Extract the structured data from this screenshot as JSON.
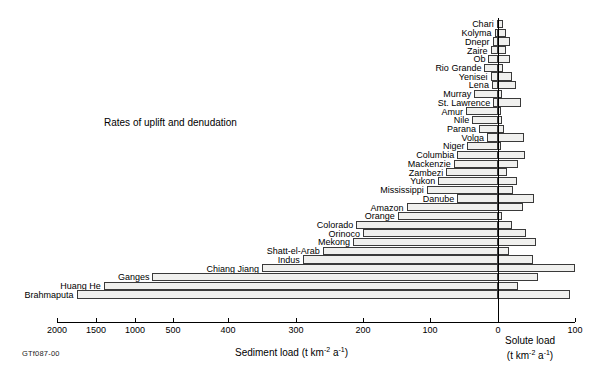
{
  "figure": {
    "note": "Rates of uplift and denudation",
    "figure_id": "GTf087-00"
  },
  "chart_data": {
    "type": "bar",
    "orientation": "horizontal-diverging",
    "title": "Rates of uplift and denudation",
    "xlabel_left": "Sediment load (t km⁻² a⁻¹)",
    "xlabel_right": "Solute load (t km⁻² a⁻¹)",
    "ylabel": "",
    "grid": false,
    "legend": "none",
    "axis_note": "Left axis (sediment load) uses a broken/compressed scale above 400; right axis is solute load 0-100.",
    "left_axis": {
      "label": "Sediment load (t km⁻² a⁻¹)",
      "ticks": [
        2000,
        1500,
        1000,
        500,
        400,
        300,
        200,
        100,
        0
      ],
      "tick_labels": [
        "2000",
        "1500",
        "1000",
        "500",
        "400",
        "300",
        "200",
        "100",
        "0"
      ],
      "tick_x": [
        57,
        96,
        135,
        173,
        228,
        296,
        363,
        430,
        498
      ]
    },
    "right_axis": {
      "label": "Solute load (t km⁻² a⁻¹)",
      "ticks": [
        0,
        100
      ],
      "tick_labels": [
        "0",
        "100"
      ],
      "tick_x": [
        498,
        575
      ]
    },
    "categories": [
      "Chari",
      "Kolyma",
      "Dnepr",
      "Zaire",
      "Ob",
      "Rio Grande",
      "Yenisei",
      "Lena",
      "Murray",
      "St. Lawrence",
      "Amur",
      "Nile",
      "Parana",
      "Volga",
      "Niger",
      "Columbia",
      "Mackenzie",
      "Zambezi",
      "Yukon",
      "Mississippi",
      "Danube",
      "Amazon",
      "Orange",
      "Colorado",
      "Orinoco",
      "Mekong",
      "Shatt-el-Arab",
      "Indus",
      "Chiang Jiang",
      "Ganges",
      "Huang He",
      "Brahmaputa"
    ],
    "series": [
      {
        "name": "Sediment load",
        "units": "t km⁻² a⁻¹",
        "side": "left",
        "values": [
          2,
          5,
          8,
          11,
          14,
          20,
          11,
          9,
          35,
          7,
          47,
          38,
          28,
          16,
          45,
          60,
          65,
          76,
          88,
          105,
          60,
          135,
          148,
          210,
          200,
          215,
          260,
          290,
          350,
          770,
          1400,
          1750
        ]
      },
      {
        "name": "Solute load",
        "units": "t km⁻² a⁻¹",
        "side": "right",
        "values": [
          6,
          11,
          16,
          10,
          16,
          7,
          18,
          23,
          5,
          30,
          4,
          5,
          8,
          34,
          4,
          35,
          26,
          12,
          25,
          20,
          47,
          32,
          5,
          18,
          36,
          49,
          14,
          45,
          100,
          52,
          26,
          93
        ]
      }
    ]
  },
  "rows": [
    {
      "label": "Chari",
      "sediment": 2,
      "solute": 6
    },
    {
      "label": "Kolyma",
      "sediment": 5,
      "solute": 11
    },
    {
      "label": "Dnepr",
      "sediment": 8,
      "solute": 16
    },
    {
      "label": "Zaire",
      "sediment": 11,
      "solute": 10
    },
    {
      "label": "Ob",
      "sediment": 14,
      "solute": 16
    },
    {
      "label": "Rio Grande",
      "sediment": 20,
      "solute": 7
    },
    {
      "label": "Yenisei",
      "sediment": 11,
      "solute": 18
    },
    {
      "label": "Lena",
      "sediment": 9,
      "solute": 23
    },
    {
      "label": "Murray",
      "sediment": 35,
      "solute": 5
    },
    {
      "label": "St. Lawrence",
      "sediment": 7,
      "solute": 30
    },
    {
      "label": "Amur",
      "sediment": 47,
      "solute": 4
    },
    {
      "label": "Nile",
      "sediment": 38,
      "solute": 5
    },
    {
      "label": "Parana",
      "sediment": 28,
      "solute": 8
    },
    {
      "label": "Volga",
      "sediment": 16,
      "solute": 34
    },
    {
      "label": "Niger",
      "sediment": 45,
      "solute": 4
    },
    {
      "label": "Columbia",
      "sediment": 60,
      "solute": 35
    },
    {
      "label": "Mackenzie",
      "sediment": 65,
      "solute": 26
    },
    {
      "label": "Zambezi",
      "sediment": 76,
      "solute": 12
    },
    {
      "label": "Yukon",
      "sediment": 88,
      "solute": 25
    },
    {
      "label": "Mississippi",
      "sediment": 105,
      "solute": 20
    },
    {
      "label": "Danube",
      "sediment": 60,
      "solute": 47
    },
    {
      "label": "Amazon",
      "sediment": 135,
      "solute": 32
    },
    {
      "label": "Orange",
      "sediment": 148,
      "solute": 5
    },
    {
      "label": "Colorado",
      "sediment": 210,
      "solute": 18
    },
    {
      "label": "Orinoco",
      "sediment": 200,
      "solute": 36
    },
    {
      "label": "Mekong",
      "sediment": 215,
      "solute": 49
    },
    {
      "label": "Shatt-el-Arab",
      "sediment": 260,
      "solute": 14
    },
    {
      "label": "Indus",
      "sediment": 290,
      "solute": 45
    },
    {
      "label": "Chiang Jiang",
      "sediment": 350,
      "solute": 100
    },
    {
      "label": "Ganges",
      "sediment": 770,
      "solute": 52
    },
    {
      "label": "Huang He",
      "sediment": 1400,
      "solute": 26
    },
    {
      "label": "Brahmaputa",
      "sediment": 1750,
      "solute": 93
    }
  ],
  "axes": {
    "left_ticks": [
      {
        "value": 2000,
        "label": "2000",
        "x": 57
      },
      {
        "value": 1500,
        "label": "1500",
        "x": 96
      },
      {
        "value": 1000,
        "label": "1000",
        "x": 135
      },
      {
        "value": 500,
        "label": "500",
        "x": 173
      },
      {
        "value": 400,
        "label": "400",
        "x": 228
      },
      {
        "value": 300,
        "label": "300",
        "x": 296
      },
      {
        "value": 200,
        "label": "200",
        "x": 363
      },
      {
        "value": 100,
        "label": "100",
        "x": 430
      },
      {
        "value": 0,
        "label": "0",
        "x": 498
      }
    ],
    "right_ticks": [
      {
        "value": 100,
        "label": "100",
        "x": 575
      }
    ],
    "sediment_title_line1": "Sediment load (t km",
    "sediment_title_sup1": "-2",
    "sediment_title_mid": " a",
    "sediment_title_sup2": "-1",
    "sediment_title_end": ")",
    "solute_title_line1": "Solute load",
    "solute_title_line2_pre": "(t km",
    "solute_title_sup1": "-2",
    "solute_title_mid": " a",
    "solute_title_sup2": "-1",
    "solute_title_end": ")"
  },
  "colors": {
    "bar_fill": "#f0f0ee",
    "bar_stroke": "#3a3a3a",
    "axis": "#000000",
    "text": "#000000",
    "background": "#ffffff"
  }
}
